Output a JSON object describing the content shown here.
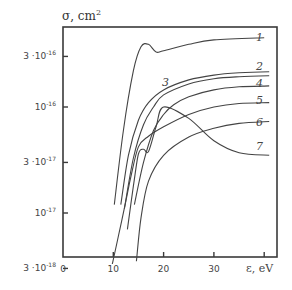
{
  "chart_data": {
    "type": "line",
    "title": "",
    "ylabel": "σ, cm²",
    "xlabel": "ε, eV",
    "yscale": "log",
    "ylim": [
      3e-18,
      8e-16
    ],
    "xlim": [
      0,
      42
    ],
    "xticks": [
      0,
      10,
      20,
      30,
      40
    ],
    "xtick_labels": [
      "0",
      "10",
      "20",
      "30",
      ""
    ],
    "yticks": [
      {
        "value": 3e-16,
        "label_base": "3 ·10",
        "label_exp": "-16"
      },
      {
        "value": 1e-16,
        "label_base": "10",
        "label_exp": "-16"
      },
      {
        "value": 3e-17,
        "label_base": "3 ·10",
        "label_exp": "-17"
      },
      {
        "value": 1e-17,
        "label_base": "10",
        "label_exp": "-17"
      },
      {
        "value": 3e-18,
        "label_base": "3 ·10",
        "label_exp": "-18"
      }
    ],
    "grid": false,
    "legend": "inline curve labels at right",
    "series": [
      {
        "name": "1",
        "x": [
          10.2,
          12,
          14,
          15.5,
          17,
          18.5,
          20,
          25,
          30,
          40
        ],
        "y": [
          1.2e-17,
          6e-17,
          2.2e-16,
          3.7e-16,
          3.9e-16,
          3.3e-16,
          3.4e-16,
          3.9e-16,
          4.3e-16,
          4.5e-16
        ]
      },
      {
        "name": "2",
        "x": [
          11.5,
          13,
          15,
          17,
          20,
          25,
          30,
          35,
          41
        ],
        "y": [
          1.2e-17,
          3.5e-17,
          7.5e-17,
          1.1e-16,
          1.45e-16,
          1.8e-16,
          2e-16,
          2.1e-16,
          2.15e-16
        ]
      },
      {
        "name": "3",
        "x": [
          12.2,
          14,
          16,
          18,
          20,
          25,
          30,
          35,
          41
        ],
        "y": [
          1.1e-17,
          3.3e-17,
          6.8e-17,
          1e-16,
          1.3e-16,
          1.65e-16,
          1.85e-16,
          1.93e-16,
          1.97e-16
        ]
      },
      {
        "name": "4",
        "x": [
          14.2,
          16,
          18,
          20,
          22,
          25,
          30,
          35,
          41
        ],
        "y": [
          1.2e-17,
          3e-17,
          6e-17,
          8.5e-17,
          1.05e-16,
          1.25e-16,
          1.45e-16,
          1.55e-16,
          1.58e-16
        ]
      },
      {
        "name": "5",
        "x": [
          9.8,
          11,
          12.5,
          13.5,
          15,
          17,
          20,
          25,
          30,
          35,
          41
        ],
        "y": [
          3.3e-18,
          6e-18,
          1.3e-17,
          2.2e-17,
          4.2e-17,
          5.3e-17,
          6.5e-17,
          8.5e-17,
          1e-16,
          1.08e-16,
          1.1e-16
        ]
      },
      {
        "name": "6",
        "x": [
          14.6,
          15.5,
          17,
          20,
          25,
          30,
          35,
          41
        ],
        "y": [
          3.5e-18,
          9e-18,
          2e-17,
          3.5e-17,
          5.2e-17,
          6.3e-17,
          7e-17,
          7.3e-17
        ]
      },
      {
        "name": "7",
        "x": [
          12.8,
          14,
          15,
          16,
          17,
          18.5,
          20,
          25,
          30,
          35,
          41
        ],
        "y": [
          7e-18,
          1.8e-17,
          3.6e-17,
          4e-17,
          3.8e-17,
          6.5e-17,
          1e-16,
          7.8e-17,
          4.8e-17,
          3.7e-17,
          3.5e-17
        ]
      }
    ],
    "curve_labels": [
      {
        "text": "1",
        "x": 256,
        "y": 39
      },
      {
        "text": "2",
        "x": 256,
        "y": 68
      },
      {
        "text": "3",
        "x": 162,
        "y": 84
      },
      {
        "text": "4",
        "x": 256,
        "y": 85
      },
      {
        "text": "5",
        "x": 256,
        "y": 102
      },
      {
        "text": "6",
        "x": 256,
        "y": 124
      },
      {
        "text": "7",
        "x": 256,
        "y": 148
      }
    ]
  },
  "axes": {
    "ylabel_base": "σ, cm",
    "ylabel_sup": "2",
    "xlabel": "ε, eV"
  }
}
